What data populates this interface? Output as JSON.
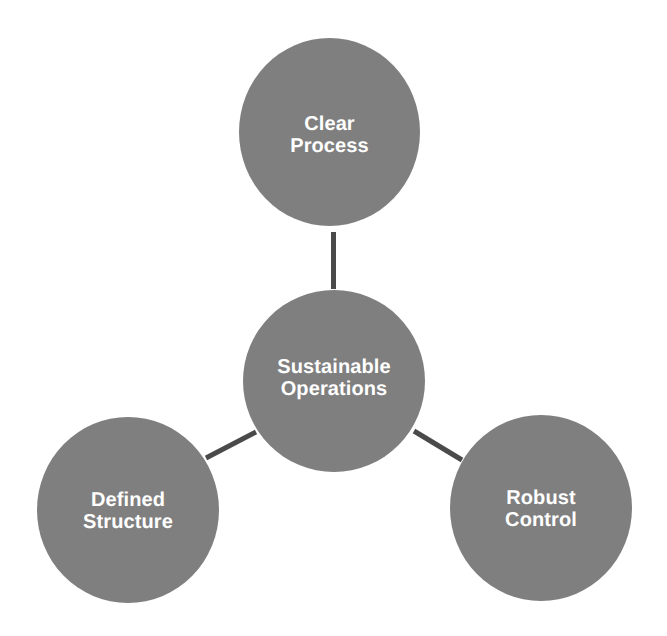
{
  "diagram": {
    "type": "hub-and-spoke",
    "background_color": "#ffffff",
    "node_fill_color": "#7f7f7f",
    "node_text_color": "#ffffff",
    "connector_color": "#4a4a4a",
    "hub": {
      "id": "center",
      "label": "Sustainable\nOperations",
      "line1": "Sustainable",
      "line2": "Operations"
    },
    "satellites": [
      {
        "id": "top",
        "label": "Clear\nProcess",
        "line1": "Clear",
        "line2": "Process",
        "position": "top"
      },
      {
        "id": "bottom-left",
        "label": "Defined\nStructure",
        "line1": "Defined",
        "line2": "Structure",
        "position": "bottom-left"
      },
      {
        "id": "bottom-right",
        "label": "Robust\nControl",
        "line1": "Robust",
        "line2": "Control",
        "position": "bottom-right"
      }
    ],
    "connectors": [
      {
        "id": "center-to-top",
        "from": "center",
        "to": "top"
      },
      {
        "id": "center-to-bottom-left",
        "from": "center",
        "to": "bottom-left"
      },
      {
        "id": "center-to-bottom-right",
        "from": "center",
        "to": "bottom-right"
      }
    ]
  }
}
